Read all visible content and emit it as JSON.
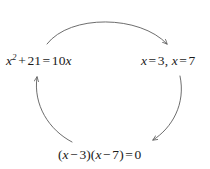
{
  "diagram": {
    "type": "cycle-diagram",
    "stroke_color": "#5c5c5c",
    "text_color": "#1a1a1a",
    "background_color": "#ffffff",
    "nodes": [
      {
        "id": "start",
        "name": "quadratic-equation",
        "text": "x² + 21 = 10x",
        "position": "left"
      },
      {
        "id": "roots",
        "name": "solution-roots",
        "text": "x = 3, x = 7",
        "position": "right"
      },
      {
        "id": "factored",
        "name": "factored-form",
        "text": "(x − 3)(x − 7) = 0",
        "position": "bottom"
      }
    ],
    "arrows": [
      {
        "id": "arc-top",
        "name": "arrow-start-to-roots",
        "from": "start",
        "to": "roots",
        "direction": "left-to-right",
        "curvature": "arc-over-top"
      },
      {
        "id": "arc-right",
        "name": "arrow-roots-to-factored",
        "from": "roots",
        "to": "factored",
        "direction": "top-to-bottom",
        "curvature": "arc-right-side"
      },
      {
        "id": "arc-left",
        "name": "arrow-factored-to-start",
        "from": "factored",
        "to": "start",
        "direction": "bottom-to-top",
        "curvature": "arc-left-side"
      }
    ]
  }
}
